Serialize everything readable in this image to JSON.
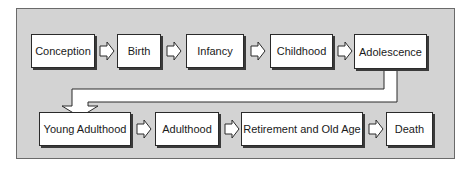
{
  "diagram": {
    "type": "flowchart",
    "title": "",
    "colors": {
      "panel_background": "#d3d3d3",
      "panel_border": "#6a6a6a",
      "box_background": "#ffffff",
      "box_border": "#2a2a2a",
      "text": "#1a1a1a"
    },
    "rows": [
      {
        "stages": [
          {
            "id": "conception",
            "label": "Conception"
          },
          {
            "id": "birth",
            "label": "Birth"
          },
          {
            "id": "infancy",
            "label": "Infancy"
          },
          {
            "id": "childhood",
            "label": "Childhood"
          },
          {
            "id": "adolescence",
            "label": "Adolescence"
          }
        ]
      },
      {
        "stages": [
          {
            "id": "young-adulthood",
            "label": "Young Adulthood"
          },
          {
            "id": "adulthood",
            "label": "Adulthood"
          },
          {
            "id": "retirement-old-age",
            "label": "Retirement and Old Age"
          },
          {
            "id": "death",
            "label": "Death"
          }
        ]
      }
    ],
    "edges": [
      {
        "from": "Conception",
        "to": "Birth",
        "icon": "hollow-right-arrow"
      },
      {
        "from": "Birth",
        "to": "Infancy",
        "icon": "hollow-right-arrow"
      },
      {
        "from": "Infancy",
        "to": "Childhood",
        "icon": "hollow-right-arrow"
      },
      {
        "from": "Childhood",
        "to": "Adolescence",
        "icon": "hollow-right-arrow"
      },
      {
        "from": "Adolescence",
        "to": "Young Adulthood",
        "icon": "hollow-elbow-down-arrow"
      },
      {
        "from": "Young Adulthood",
        "to": "Adulthood",
        "icon": "hollow-right-arrow"
      },
      {
        "from": "Adulthood",
        "to": "Retirement and Old Age",
        "icon": "hollow-right-arrow"
      },
      {
        "from": "Retirement and Old Age",
        "to": "Death",
        "icon": "hollow-right-arrow"
      }
    ]
  }
}
